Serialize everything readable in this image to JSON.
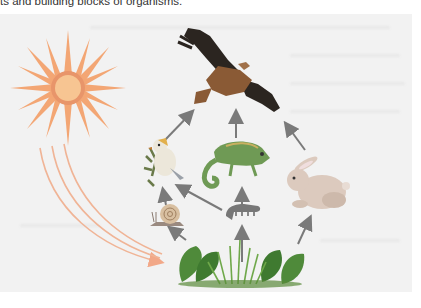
{
  "caption": {
    "text": "ts and building blocks of organisms."
  },
  "diagram": {
    "type": "food-web",
    "colors": {
      "panel_bg": "#f2f2f2",
      "arrow": "#7a7a7a",
      "sun_rays": "#f0a070",
      "sun_core": "#f6c08a",
      "sun_ring": "#e8956a",
      "energy_arrows": "#f2b090",
      "plant_leaf": "#4f8a3a",
      "grass": "#6fa84a",
      "eagle_dark": "#2a2520",
      "eagle_body": "#8a5a35",
      "rabbit": "#d9c9bd",
      "chameleon": "#6f9a55",
      "bird": "#e9e4d8",
      "snail_shell": "#d8c0a0",
      "caterpillar": "#7a7a7a"
    },
    "nodes": [
      {
        "id": "sun",
        "label": "sun"
      },
      {
        "id": "plants",
        "label": "plants and grass"
      },
      {
        "id": "snail",
        "label": "snail"
      },
      {
        "id": "caterpillar",
        "label": "caterpillar"
      },
      {
        "id": "rabbit",
        "label": "rabbit"
      },
      {
        "id": "bird",
        "label": "small bird"
      },
      {
        "id": "chameleon",
        "label": "chameleon"
      },
      {
        "id": "eagle",
        "label": "eagle"
      }
    ],
    "edges": [
      {
        "from": "sun",
        "to": "plants"
      },
      {
        "from": "plants",
        "to": "snail"
      },
      {
        "from": "plants",
        "to": "caterpillar"
      },
      {
        "from": "plants",
        "to": "rabbit"
      },
      {
        "from": "snail",
        "to": "bird"
      },
      {
        "from": "caterpillar",
        "to": "bird"
      },
      {
        "from": "caterpillar",
        "to": "chameleon"
      },
      {
        "from": "bird",
        "to": "eagle"
      },
      {
        "from": "chameleon",
        "to": "eagle"
      },
      {
        "from": "rabbit",
        "to": "eagle"
      }
    ]
  }
}
